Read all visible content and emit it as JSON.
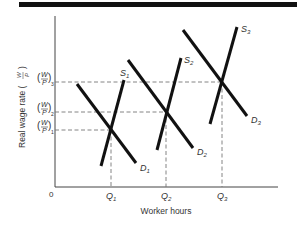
{
  "diagram": {
    "type": "supply-demand",
    "title_bar_color": "#111111",
    "line_color": "#111111",
    "axis_color": "#444444",
    "dash_color": "#777777",
    "axes": {
      "origin_label": "0",
      "x_label": "Worker hours",
      "y_label": "Real wage rate (W/P)",
      "y_label_text": "Real wage rate (",
      "y_label_frac_num": "W",
      "y_label_frac_den": "P",
      "y_label_close": ")"
    },
    "y_ticks": [
      {
        "num": "W",
        "den": "P",
        "sub": "3",
        "label": "(W/P)3"
      },
      {
        "num": "W",
        "den": "P",
        "sub": "2",
        "label": "(W/P)2"
      },
      {
        "num": "W",
        "den": "P",
        "sub": "1",
        "label": "(W/P)1"
      }
    ],
    "x_ticks": [
      {
        "base": "Q",
        "sub": "1",
        "label": "Q1"
      },
      {
        "base": "Q",
        "sub": "2",
        "label": "Q2"
      },
      {
        "base": "Q",
        "sub": "3",
        "label": "Q3"
      }
    ],
    "supply_curves": [
      {
        "base": "S",
        "sub": "1",
        "label": "S1"
      },
      {
        "base": "S",
        "sub": "2",
        "label": "S2"
      },
      {
        "base": "S",
        "sub": "3",
        "label": "S3"
      }
    ],
    "demand_curves": [
      {
        "base": "D",
        "sub": "1",
        "label": "D1"
      },
      {
        "base": "D",
        "sub": "2",
        "label": "D2"
      },
      {
        "base": "D",
        "sub": "3",
        "label": "D3"
      }
    ],
    "equilibria": [
      {
        "quantity": "Q1",
        "wage": "(W/P)1"
      },
      {
        "quantity": "Q2",
        "wage": "(W/P)2"
      },
      {
        "quantity": "Q3",
        "wage": "(W/P)3"
      }
    ]
  }
}
